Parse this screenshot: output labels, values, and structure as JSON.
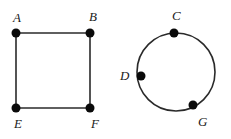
{
  "diagram": {
    "type": "graph-figures",
    "colors": {
      "stroke": "#2a2a2a",
      "vertex": "#0a0a0a",
      "label": "#1a1a1a",
      "background": "#ffffff"
    },
    "square": {
      "vertices": [
        {
          "id": "A",
          "label": "A",
          "x": 16,
          "y": 33,
          "lx": 13,
          "ly": 22
        },
        {
          "id": "B",
          "label": "B",
          "x": 90,
          "y": 33,
          "lx": 89,
          "ly": 21
        },
        {
          "id": "E",
          "label": "E",
          "x": 16,
          "y": 108,
          "lx": 14,
          "ly": 128
        },
        {
          "id": "F",
          "label": "F",
          "x": 90,
          "y": 108,
          "lx": 91,
          "ly": 128
        }
      ],
      "edges": [
        [
          "A",
          "B"
        ],
        [
          "B",
          "F"
        ],
        [
          "F",
          "E"
        ],
        [
          "E",
          "A"
        ]
      ]
    },
    "circle": {
      "cx": 176,
      "cy": 72,
      "r": 39,
      "vertices": [
        {
          "id": "C",
          "label": "C",
          "x": 174,
          "y": 33,
          "lx": 172,
          "ly": 20
        },
        {
          "id": "D",
          "label": "D",
          "x": 141,
          "y": 76,
          "lx": 120,
          "ly": 80
        },
        {
          "id": "G",
          "label": "G",
          "x": 193,
          "y": 105,
          "lx": 198,
          "ly": 126
        }
      ]
    }
  }
}
